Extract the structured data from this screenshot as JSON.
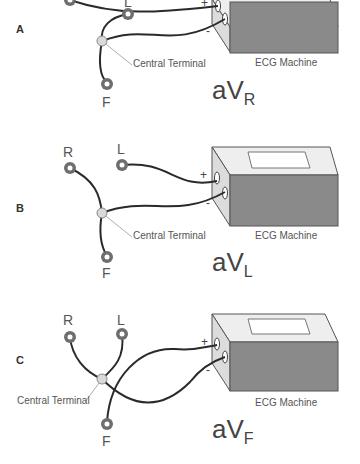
{
  "figure": {
    "panels": [
      {
        "letter": "A",
        "electrodes": {
          "R": "R",
          "L": "L",
          "F": "F"
        },
        "central_terminal_label": "Central Terminal",
        "machine_label": "ECG Machine",
        "positive_sign": "+",
        "negative_sign": "-",
        "lead_prefix": "aV",
        "lead_sub": "R"
      },
      {
        "letter": "B",
        "electrodes": {
          "R": "R",
          "L": "L",
          "F": "F"
        },
        "central_terminal_label": "Central Terminal",
        "machine_label": "ECG Machine",
        "positive_sign": "+",
        "negative_sign": "-",
        "lead_prefix": "aV",
        "lead_sub": "L"
      },
      {
        "letter": "C",
        "electrodes": {
          "R": "R",
          "L": "L",
          "F": "F"
        },
        "central_terminal_label": "Central Terminal",
        "machine_label": "ECG Machine",
        "positive_sign": "+",
        "negative_sign": "-",
        "lead_prefix": "aV",
        "lead_sub": "F"
      }
    ],
    "colors": {
      "wire": "#2a2a2a",
      "electrode_ring": "#6e6e6e",
      "terminal": "#d9d9d9",
      "box_front": "#8a8a8a",
      "box_top": "#eeeeee",
      "box_side": "#dcdcdc"
    }
  }
}
